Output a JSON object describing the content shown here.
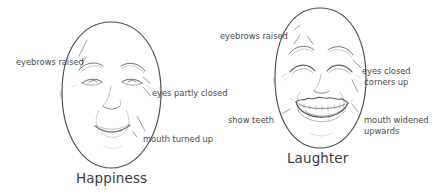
{
  "diagram": {
    "background_color": "#ffffff",
    "line_color": "#4a4a4a",
    "label_color": "#4a4a4a",
    "caption_color": "#3b3b3b"
  },
  "faces": [
    {
      "id": "happiness",
      "caption": "Happiness",
      "annotations": [
        {
          "id": "eyebrows-raised",
          "text": "eyebrows raised"
        },
        {
          "id": "eyes-partly-closed",
          "text": "eyes partly closed"
        },
        {
          "id": "mouth-turned-up",
          "text": "mouth turned up"
        }
      ]
    },
    {
      "id": "laughter",
      "caption": "Laughter",
      "annotations": [
        {
          "id": "eyebrows-raised",
          "text": "eyebrows raised"
        },
        {
          "id": "eyes-closed",
          "line1": "eyes closed",
          "line2": "corners up"
        },
        {
          "id": "show-teeth",
          "text": "show teeth"
        },
        {
          "id": "mouth-widened",
          "line1": "mouth widened",
          "line2": "upwards"
        }
      ]
    }
  ]
}
